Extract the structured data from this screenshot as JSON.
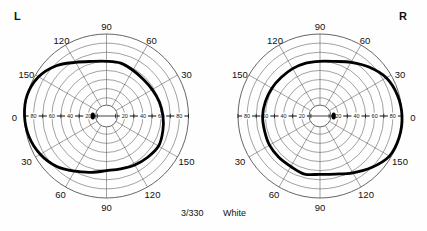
{
  "document": {
    "kind": "goldmann-kinetic-perimetry-chart",
    "eyes": [
      {
        "id": "left",
        "marker": "L"
      },
      {
        "id": "right",
        "marker": "R"
      }
    ]
  },
  "footer": {
    "target_size": "3/330",
    "stimulus_color": "White"
  },
  "colors": {
    "ink": "#111111",
    "grid": "#555555",
    "isopter": "#000000",
    "paper": "#fefefe"
  },
  "chart_data": {
    "type": "line",
    "coordinate_system": "polar",
    "xlabel": "Meridian (degrees)",
    "ylabel": "Eccentricity (degrees)",
    "grid": true,
    "legend_position": "none",
    "radial_ticks": [
      10,
      20,
      30,
      40,
      50,
      60,
      70,
      80,
      90
    ],
    "radial_tick_labels_shown": [
      "20",
      "40",
      "60",
      "80"
    ],
    "rlim": [
      0,
      90
    ],
    "meridian_spokes_deg": [
      0,
      30,
      60,
      90,
      120,
      150,
      180,
      210,
      240,
      270,
      300,
      330
    ],
    "angle_labels": {
      "left_eye": {
        "top": [
          "120",
          "90",
          "60"
        ],
        "left": [
          "150",
          "0",
          "30"
        ],
        "right": [
          "30",
          "150"
        ],
        "bottom": [
          "60",
          "90",
          "120"
        ]
      },
      "right_eye": {
        "top": [
          "120",
          "90",
          "60"
        ],
        "left": [
          "150",
          "30"
        ],
        "right": [
          "30",
          "0",
          "150"
        ],
        "bottom": [
          "60",
          "90",
          "120"
        ]
      }
    },
    "horizontal_axis_tick_labels": {
      "left_eye": [
        "0",
        "80",
        "60",
        "40",
        "20",
        "20",
        "40",
        "60",
        "80"
      ],
      "right_eye": [
        "80",
        "60",
        "40",
        "20",
        "20",
        "40",
        "60",
        "80",
        "0"
      ]
    },
    "series": [
      {
        "name": "Left eye isopter (III/4e)",
        "eye": "left",
        "angles_deg": [
          0,
          15,
          30,
          45,
          60,
          75,
          90,
          105,
          120,
          135,
          150,
          165,
          180,
          195,
          210,
          225,
          240,
          255,
          270,
          285,
          300,
          315,
          330,
          345
        ],
        "radii_deg": [
          62,
          60,
          58,
          57,
          58,
          60,
          60,
          62,
          68,
          78,
          86,
          90,
          90,
          88,
          84,
          78,
          70,
          64,
          60,
          60,
          62,
          64,
          66,
          64
        ]
      },
      {
        "name": "Right eye isopter (III/4e)",
        "eye": "right",
        "angles_deg": [
          0,
          15,
          30,
          45,
          60,
          75,
          90,
          105,
          120,
          135,
          150,
          165,
          180,
          195,
          210,
          225,
          240,
          255,
          270,
          285,
          300,
          315,
          330,
          345
        ],
        "radii_deg": [
          90,
          88,
          84,
          76,
          68,
          62,
          60,
          60,
          60,
          60,
          61,
          62,
          63,
          63,
          64,
          64,
          64,
          66,
          64,
          66,
          72,
          80,
          88,
          90
        ]
      }
    ],
    "blind_spots": [
      {
        "eye": "left",
        "meridian_deg": 180,
        "eccentricity_deg": 15,
        "shape": "filled-oval"
      },
      {
        "eye": "right",
        "meridian_deg": 0,
        "eccentricity_deg": 15,
        "shape": "filled-oval"
      }
    ],
    "central_scotoma_circle_deg": 12
  }
}
